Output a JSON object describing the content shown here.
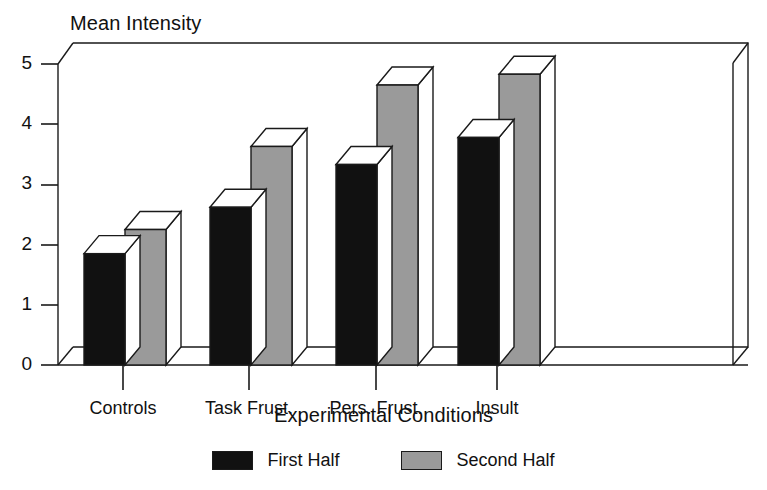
{
  "chart_data": {
    "type": "bar",
    "title": "",
    "ylabel": "Mean Intensity",
    "xlabel": "Experimental Conditions",
    "categories": [
      "Controls",
      "Task Frust.",
      "Pers. Frust.",
      "Insult"
    ],
    "series": [
      {
        "name": "First Half",
        "color": "#111111",
        "values": [
          1.85,
          2.62,
          3.33,
          3.78
        ]
      },
      {
        "name": "Second Half",
        "color": "#9a9a9a",
        "values": [
          2.25,
          3.63,
          4.65,
          4.83
        ]
      }
    ],
    "ylim": [
      0,
      5
    ],
    "yticks": [
      0,
      1,
      2,
      3,
      4,
      5
    ],
    "ytick_labels": [
      "0",
      "1",
      "2",
      "3",
      "4",
      "5"
    ],
    "grid": false,
    "legend_position": "bottom",
    "style": "3d-bars"
  },
  "legend": {
    "entries": [
      {
        "label": "First Half",
        "color": "#111111"
      },
      {
        "label": "Second Half",
        "color": "#9a9a9a"
      }
    ]
  },
  "colors": {
    "first_half": "#111111",
    "second_half": "#9a9a9a",
    "bar_top": "#ffffff",
    "outline": "#1a1a1a",
    "background": "#ffffff"
  }
}
